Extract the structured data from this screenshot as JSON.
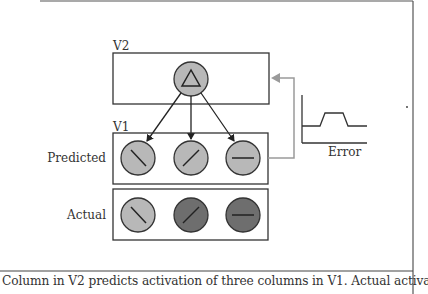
{
  "labels": {
    "v2": "V2",
    "v1": "V1",
    "predicted": "Predicted",
    "actual": "Actual",
    "error": "Error"
  },
  "caption": "Column in V2 predicts activation of three columns in V1. Actual activation",
  "colors": {
    "predicted_fill": "#b8b8b8",
    "actual_active_fill": "#6e6e6e",
    "actual_inactive_fill": "#b8b8b8",
    "feedback_arrow": "#9a9a9a",
    "stroke": "#333333"
  },
  "v2_column": {
    "icon": "triangle"
  },
  "v1_predicted": [
    {
      "orientation": "backslash",
      "state": "predicted"
    },
    {
      "orientation": "slash",
      "state": "predicted"
    },
    {
      "orientation": "horizontal",
      "state": "predicted"
    }
  ],
  "v1_actual": [
    {
      "orientation": "backslash",
      "state": "inactive"
    },
    {
      "orientation": "slash",
      "state": "active"
    },
    {
      "orientation": "horizontal",
      "state": "active"
    }
  ]
}
